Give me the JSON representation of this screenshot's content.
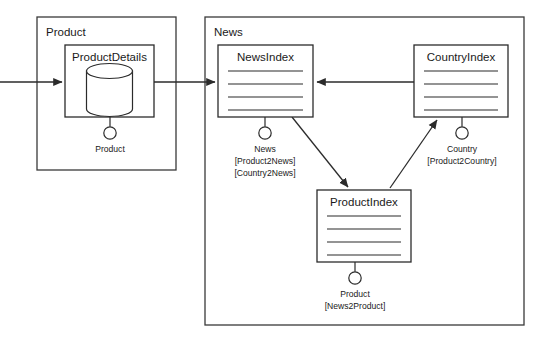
{
  "diagram": {
    "type": "component-diagram",
    "frames": [
      {
        "id": "product-frame",
        "label": "Product",
        "x": 37,
        "y": 17,
        "w": 139,
        "h": 153
      },
      {
        "id": "news-frame",
        "label": "News",
        "x": 205,
        "y": 17,
        "w": 319,
        "h": 308
      }
    ],
    "components": [
      {
        "id": "product-details",
        "title": "ProductDetails",
        "kind": "database",
        "x": 65,
        "y": 45,
        "w": 89,
        "h": 72
      },
      {
        "id": "news-index",
        "title": "NewsIndex",
        "kind": "index",
        "x": 218,
        "y": 45,
        "w": 95,
        "h": 72
      },
      {
        "id": "country-index",
        "title": "CountryIndex",
        "kind": "index",
        "x": 414,
        "y": 45,
        "w": 94,
        "h": 72
      },
      {
        "id": "product-index",
        "title": "ProductIndex",
        "kind": "index",
        "x": 317,
        "y": 190,
        "w": 94,
        "h": 72
      }
    ],
    "interfaces": [
      {
        "id": "product-details-iface",
        "owner": "product-details",
        "name": "Product",
        "bindings": [],
        "cx": 110,
        "cy": 133,
        "stem_from_y": 117
      },
      {
        "id": "news-index-iface",
        "owner": "news-index",
        "name": "News",
        "bindings": [
          "[Product2News]",
          "[Country2News]"
        ],
        "cx": 265,
        "cy": 133,
        "stem_from_y": 117
      },
      {
        "id": "country-index-iface",
        "owner": "country-index",
        "name": "Country",
        "bindings": [
          "[Product2Country]"
        ],
        "cx": 462,
        "cy": 133,
        "stem_from_y": 117
      },
      {
        "id": "product-index-iface",
        "owner": "product-index",
        "name": "Product",
        "bindings": [
          "[News2Product]"
        ],
        "cx": 355,
        "cy": 278,
        "stem_from_y": 262
      }
    ],
    "connectors": [
      {
        "id": "external-to-product-details",
        "from": "external-left",
        "to": "product-details",
        "kind": "arrow",
        "path": "M 0 82 L 62 82"
      },
      {
        "id": "product-details-to-news-index",
        "from": "product-details",
        "to": "news-index",
        "kind": "arrow",
        "path": "M 154 82 L 215 82"
      },
      {
        "id": "country-index-to-news-index",
        "from": "country-index",
        "to": "news-index",
        "kind": "arrow",
        "path": "M 414 82 L 317 82"
      },
      {
        "id": "news-index-to-product-index",
        "from": "news-index",
        "to": "product-index",
        "kind": "arrow",
        "path": "M 292 117 L 348 187"
      },
      {
        "id": "product-index-to-country-index",
        "from": "product-index",
        "to": "country-index",
        "kind": "arrow",
        "path": "M 390 188 L 437 120"
      }
    ],
    "colors": {
      "background": "#ffffff",
      "stroke": "#2b2b2b",
      "frame_stroke": "#3a3a3a",
      "text": "#1a1a1a"
    }
  }
}
